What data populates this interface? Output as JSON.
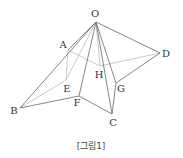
{
  "figure": {
    "caption": "[그림1]",
    "points": {
      "O": {
        "label": "O",
        "x": 96,
        "y": 22,
        "lx": 95,
        "ly": 17
      },
      "A": {
        "label": "A",
        "x": 68,
        "y": 50,
        "lx": 63,
        "ly": 48
      },
      "B": {
        "label": "B",
        "x": 20,
        "y": 108,
        "lx": 14,
        "ly": 114
      },
      "C": {
        "label": "C",
        "x": 112,
        "y": 114,
        "lx": 113,
        "ly": 126
      },
      "D": {
        "label": "D",
        "x": 160,
        "y": 53,
        "lx": 166,
        "ly": 57
      },
      "E": {
        "label": "E",
        "x": 66,
        "y": 80,
        "lx": 67,
        "ly": 92
      },
      "F": {
        "label": "F",
        "x": 79,
        "y": 96,
        "lx": 77,
        "ly": 106
      },
      "G": {
        "label": "G",
        "x": 116,
        "y": 83,
        "lx": 121,
        "ly": 92
      },
      "H": {
        "label": "H",
        "x": 100,
        "y": 66,
        "lx": 99,
        "ly": 78
      }
    },
    "solid_edges": [
      [
        "O",
        "A"
      ],
      [
        "O",
        "B"
      ],
      [
        "O",
        "F"
      ],
      [
        "O",
        "C"
      ],
      [
        "O",
        "G"
      ],
      [
        "O",
        "D"
      ],
      [
        "B",
        "F"
      ],
      [
        "F",
        "C"
      ],
      [
        "G",
        "C"
      ],
      [
        "G",
        "D"
      ]
    ],
    "light_edges": [
      [
        "O",
        "E"
      ],
      [
        "O",
        "H"
      ],
      [
        "A",
        "E"
      ],
      [
        "A",
        "H"
      ],
      [
        "B",
        "E"
      ],
      [
        "H",
        "D"
      ]
    ],
    "colors": {
      "solid": "#777777",
      "light": "#bbbbbb",
      "text": "#333333"
    }
  }
}
